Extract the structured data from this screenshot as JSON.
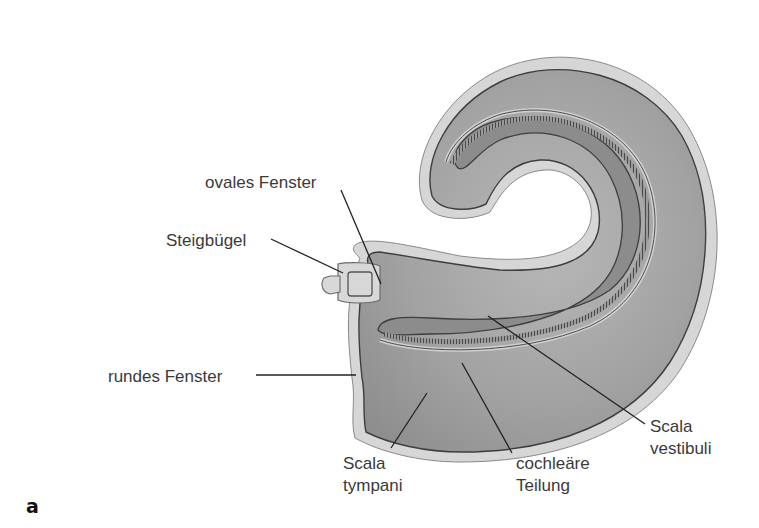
{
  "figure": {
    "panel_label": "a",
    "colors": {
      "background": "#ffffff",
      "outer_wall": "#9a9a9a",
      "fluid_fill": "#a8a8a8",
      "light_rim": "#d8d8d8",
      "outline": "#444444",
      "label_text": "#3a3a3a"
    }
  },
  "labels": {
    "ovales_fenster": "ovales Fenster",
    "steigbuegel": "Steigbügel",
    "rundes_fenster": "rundes Fenster",
    "scala_tympani_1": "Scala",
    "scala_tympani_2": "tympani",
    "cochleare_teilung_1": "cochleäre",
    "cochleare_teilung_2": "Teilung",
    "scala_vestibuli_1": "Scala",
    "scala_vestibuli_2": "vestibuli"
  }
}
